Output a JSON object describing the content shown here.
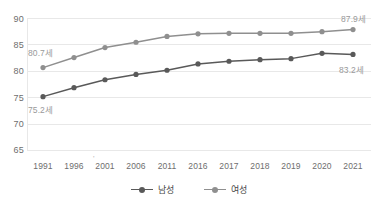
{
  "chart_data": {
    "type": "line",
    "title": "",
    "subtitle": "",
    "xlabel": "",
    "ylabel": "",
    "ylim": [
      65,
      90
    ],
    "yticks": [
      65,
      70,
      75,
      80,
      85,
      90
    ],
    "grid": true,
    "legend_position": "bottom-center",
    "categories": [
      "1991",
      "1996",
      "2001",
      "2006",
      "2011",
      "2016",
      "2017",
      "2018",
      "2019",
      "2020",
      "2021"
    ],
    "series": [
      {
        "name": "남성",
        "color": "#595959",
        "values": [
          75.2,
          76.9,
          78.4,
          79.4,
          80.2,
          81.4,
          81.9,
          82.2,
          82.4,
          83.4,
          83.2
        ]
      },
      {
        "name": "여성",
        "color": "#8f8f8f",
        "values": [
          80.7,
          82.6,
          84.5,
          85.5,
          86.6,
          87.1,
          87.2,
          87.2,
          87.2,
          87.5,
          87.9
        ]
      }
    ],
    "annotations": [
      {
        "name": "female-start-label",
        "text": "80.7세",
        "series": "여성",
        "category": "1991"
      },
      {
        "name": "male-start-label",
        "text": "75.2세",
        "series": "남성",
        "category": "1991"
      },
      {
        "name": "female-end-label",
        "text": "87.9세",
        "series": "여성",
        "category": "2021"
      },
      {
        "name": "male-end-label",
        "text": "83.2세",
        "series": "남성",
        "category": "2021"
      }
    ],
    "stray_tick_mark": "'"
  },
  "axis": {
    "y_ticks": [
      "90",
      "85",
      "80",
      "75",
      "70",
      "65"
    ],
    "x_ticks": [
      "1991",
      "1996",
      "2001",
      "2006",
      "2011",
      "2016",
      "2017",
      "2018",
      "2019",
      "2020",
      "2021"
    ]
  },
  "legend": {
    "items": [
      {
        "label": "남성",
        "color": "#595959"
      },
      {
        "label": "여성",
        "color": "#8f8f8f"
      }
    ]
  },
  "colors": {
    "male": "#595959",
    "female": "#8f8f8f",
    "grid": "#e8e8e8",
    "axis_text": "#6e6e6e",
    "label_text": "#9a9a9a",
    "background": "#ffffff"
  }
}
